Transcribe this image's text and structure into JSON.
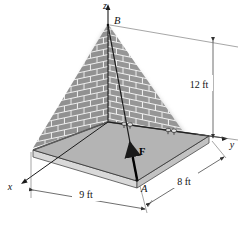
{
  "figure": {
    "type": "engineering-statics-3d-diagram"
  },
  "axes": {
    "z_label": "z",
    "y_label": "y",
    "x_label": "x"
  },
  "points": {
    "b_label": "B",
    "a_label": "A"
  },
  "force": {
    "label": "F"
  },
  "dimensions": {
    "height": "12 ft",
    "width_left": "9 ft",
    "width_right": "8 ft"
  },
  "colors": {
    "plate_top": "#b4b4b4",
    "plate_edge": "#8c8c8c",
    "plate_side": "#d2d2d2",
    "brick_wall": "#9a9a9a",
    "brick_mortar": "#e8e8e8",
    "line": "#1a1a1a",
    "dim_line": "#555555",
    "background": "#ffffff"
  }
}
